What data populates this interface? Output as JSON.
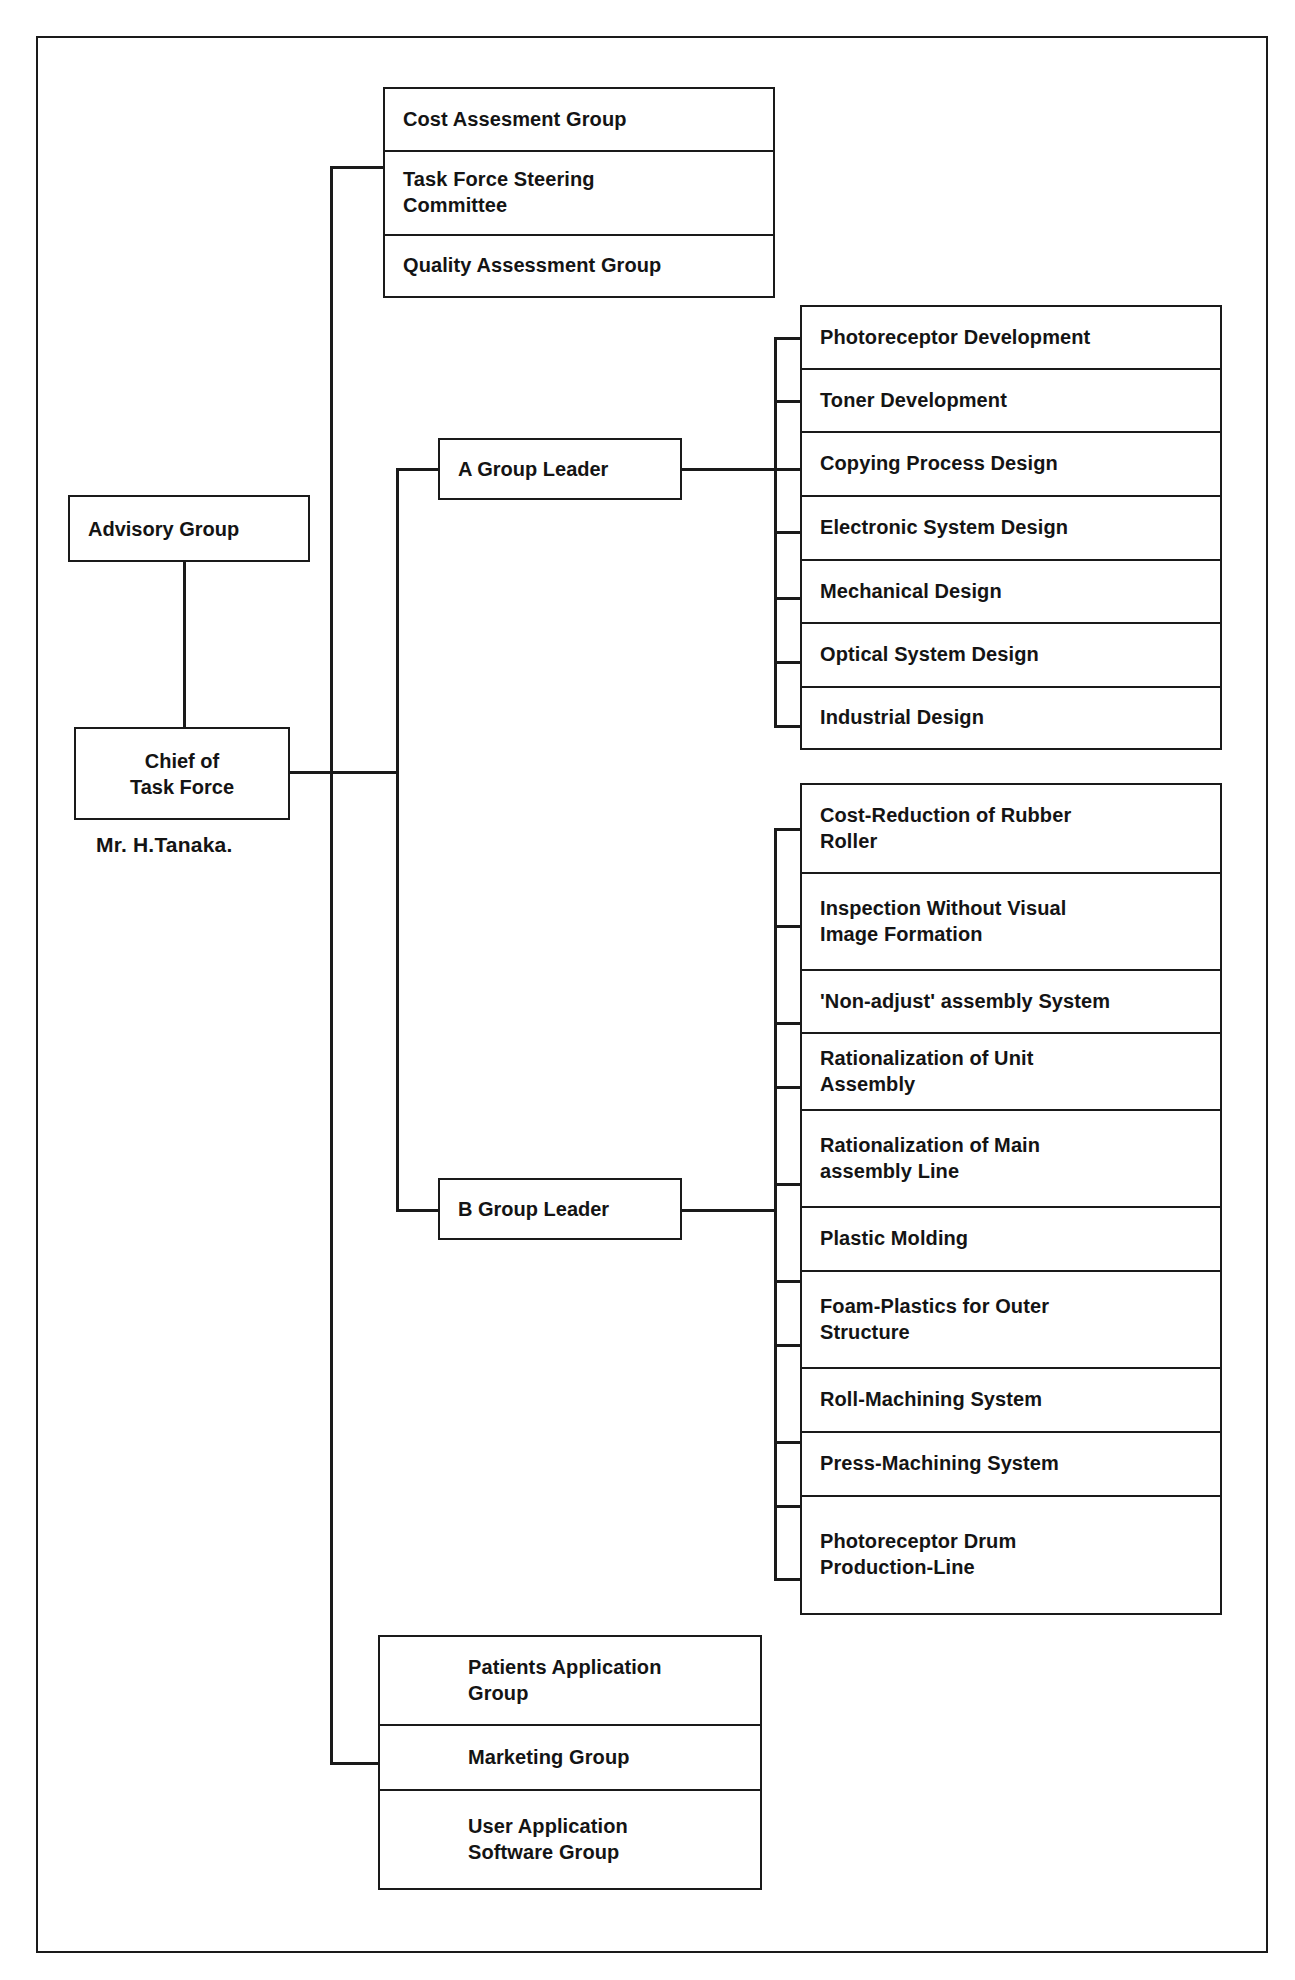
{
  "chart_title": "Task Force Organization Chart",
  "root": {
    "advisory": {
      "label": "Advisory Group"
    },
    "chief": {
      "label": "Chief of\nTask Force",
      "caption": "Mr. H.Tanaka."
    }
  },
  "staff_groups": {
    "items": [
      {
        "label": "Cost Assesment Group"
      },
      {
        "label": "Task Force Steering\nCommittee"
      },
      {
        "label": "Quality Assessment Group"
      }
    ]
  },
  "group_a": {
    "leader_label": "A Group Leader",
    "tasks": [
      {
        "label": "Photoreceptor Development"
      },
      {
        "label": "Toner Development"
      },
      {
        "label": "Copying Process Design"
      },
      {
        "label": "Electronic System Design"
      },
      {
        "label": "Mechanical Design"
      },
      {
        "label": "Optical System Design"
      },
      {
        "label": "Industrial Design"
      }
    ]
  },
  "group_b": {
    "leader_label": "B Group Leader",
    "tasks": [
      {
        "label": "Cost-Reduction of Rubber\nRoller"
      },
      {
        "label": "Inspection Without Visual\nImage Formation"
      },
      {
        "label": "'Non-adjust' assembly System"
      },
      {
        "label": "Rationalization of Unit\nAssembly"
      },
      {
        "label": "Rationalization of Main\nassembly Line"
      },
      {
        "label": "Plastic Molding"
      },
      {
        "label": "Foam-Plastics for Outer\nStructure"
      },
      {
        "label": "Roll-Machining System"
      },
      {
        "label": "Press-Machining System"
      },
      {
        "label": "Photoreceptor Drum\nProduction-Line"
      }
    ]
  },
  "application_groups": {
    "items": [
      {
        "label": "Patients Application\nGroup"
      },
      {
        "label": "Marketing Group"
      },
      {
        "label": "User Application\nSoftware Group"
      }
    ]
  },
  "colors": {
    "line": "#1a1a1a",
    "text": "#141414",
    "background": "#ffffff"
  }
}
